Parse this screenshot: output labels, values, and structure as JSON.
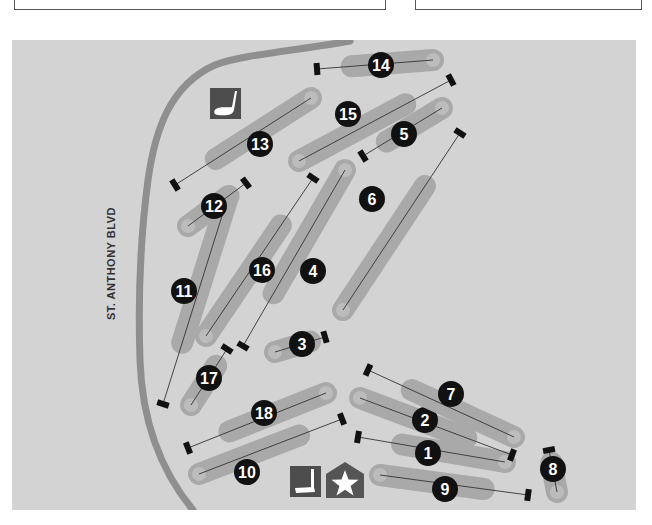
{
  "map": {
    "title": "Golf course map",
    "colors": {
      "background": "#d3d3d3",
      "fairway": "#a9a9a9",
      "green": "#bcbcbc",
      "road": "#8f8f8f",
      "hole_marker": "#111111",
      "icon_bg": "#4d4d4d"
    },
    "road": {
      "label": "ST. ANTHONY BLVD"
    },
    "amenities": [
      {
        "name": "driving-range",
        "icon": "golf-club-icon",
        "x": 210,
        "y": 88
      },
      {
        "name": "putting-green",
        "icon": "putter-icon",
        "x": 290,
        "y": 466
      },
      {
        "name": "clubhouse",
        "icon": "clubhouse-star-icon",
        "x": 326,
        "y": 464
      }
    ],
    "holes": [
      {
        "number": "1",
        "tee": [
          358,
          437
        ],
        "green": [
          505,
          462
        ],
        "label": [
          428,
          453
        ]
      },
      {
        "number": "2",
        "tee": [
          512,
          455
        ],
        "green": [
          360,
          398
        ],
        "label": [
          425,
          420
        ]
      },
      {
        "number": "3",
        "tee": [
          325,
          337
        ],
        "green": [
          275,
          352
        ],
        "label": [
          302,
          344
        ]
      },
      {
        "number": "4",
        "tee": [
          243,
          346
        ],
        "green": [
          345,
          170
        ],
        "label": [
          313,
          271
        ]
      },
      {
        "number": "5",
        "tee": [
          363,
          156
        ],
        "green": [
          442,
          108
        ],
        "label": [
          404,
          134
        ]
      },
      {
        "number": "6",
        "tee": [
          460,
          133
        ],
        "green": [
          343,
          310
        ],
        "label": [
          372,
          199
        ]
      },
      {
        "number": "7",
        "tee": [
          368,
          370
        ],
        "green": [
          514,
          437
        ],
        "label": [
          451,
          394
        ]
      },
      {
        "number": "8",
        "tee": [
          549,
          450
        ],
        "green": [
          557,
          492
        ],
        "label": [
          553,
          469
        ]
      },
      {
        "number": "9",
        "tee": [
          528,
          495
        ],
        "green": [
          380,
          475
        ],
        "label": [
          445,
          489
        ]
      },
      {
        "number": "10",
        "tee": [
          342,
          419
        ],
        "green": [
          199,
          474
        ],
        "label": [
          247,
          472
        ]
      },
      {
        "number": "11",
        "tee": [
          163,
          404
        ],
        "green": [
          227,
          200
        ],
        "label": [
          184,
          291
        ]
      },
      {
        "number": "12",
        "tee": [
          246,
          183
        ],
        "green": [
          188,
          226
        ],
        "label": [
          214,
          206
        ]
      },
      {
        "number": "13",
        "tee": [
          175,
          185
        ],
        "green": [
          311,
          98
        ],
        "label": [
          260,
          144
        ]
      },
      {
        "number": "14",
        "tee": [
          317,
          69
        ],
        "green": [
          433,
          60
        ],
        "label": [
          381,
          65
        ]
      },
      {
        "number": "15",
        "tee": [
          451,
          80
        ],
        "green": [
          299,
          161
        ],
        "label": [
          348,
          114
        ]
      },
      {
        "number": "16",
        "tee": [
          313,
          178
        ],
        "green": [
          206,
          336
        ],
        "label": [
          262,
          270
        ]
      },
      {
        "number": "17",
        "tee": [
          227,
          349
        ],
        "green": [
          191,
          405
        ],
        "label": [
          209,
          378
        ]
      },
      {
        "number": "18",
        "tee": [
          188,
          448
        ],
        "green": [
          326,
          393
        ],
        "label": [
          264,
          413
        ]
      }
    ]
  }
}
